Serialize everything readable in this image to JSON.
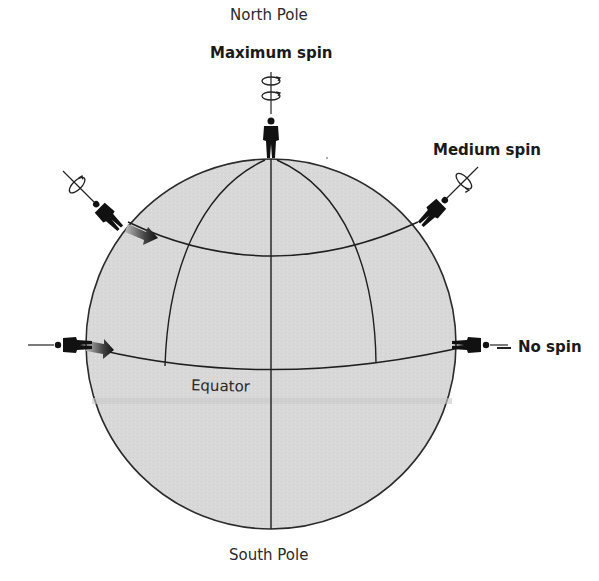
{
  "labels": {
    "north_pole": "North Pole",
    "south_pole": "South Pole",
    "equator": "Equator",
    "maximum_spin": "Maximum spin",
    "medium_spin": "Medium spin",
    "no_spin": "No spin"
  },
  "figure": {
    "observers": [
      {
        "position": "North Pole",
        "spin": "Maximum spin",
        "rotation_arrows": 2
      },
      {
        "position": "mid-latitude right",
        "spin": "Medium spin",
        "rotation_arrows": 1
      },
      {
        "position": "mid-latitude left",
        "spin": "",
        "rotation_arrows": 1
      },
      {
        "position": "equator right",
        "spin": "No spin",
        "rotation_arrows": 0
      },
      {
        "position": "equator left",
        "spin": "",
        "rotation_arrows": 0
      }
    ],
    "motion_arrows": [
      "mid-latitude eastward",
      "equator eastward"
    ]
  },
  "colors": {
    "globe_fill": "#d9d9d9",
    "outline": "#2b2b2b",
    "figure": "#111111",
    "background": "#ffffff"
  }
}
